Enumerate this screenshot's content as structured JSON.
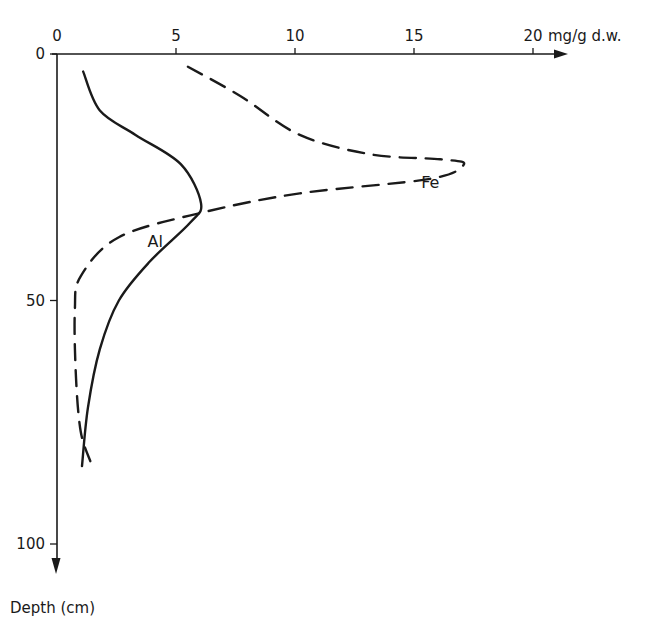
{
  "chart_data": {
    "type": "line",
    "title": "",
    "xlabel": "mg/g d.w.",
    "ylabel": "Depth (cm)",
    "x_axis_position": "top",
    "y_axis_inverted": true,
    "xlim": [
      0,
      21
    ],
    "ylim": [
      0,
      105
    ],
    "x_ticks": [
      0,
      5,
      10,
      15,
      20
    ],
    "x_tick_labels": [
      "0",
      "5",
      "10",
      "15",
      "20"
    ],
    "y_ticks": [
      0,
      50,
      100
    ],
    "y_tick_labels": [
      "0",
      "50",
      "100"
    ],
    "grid": false,
    "legend": "inline labels",
    "series": [
      {
        "name": "Al",
        "style": "solid",
        "label_position": {
          "x": 3.8,
          "depth": 39
        },
        "points": [
          {
            "x": 1.1,
            "depth": 3
          },
          {
            "x": 1.8,
            "depth": 11
          },
          {
            "x": 3.3,
            "depth": 16
          },
          {
            "x": 5.2,
            "depth": 22
          },
          {
            "x": 6.05,
            "depth": 30
          },
          {
            "x": 5.6,
            "depth": 34
          },
          {
            "x": 3.9,
            "depth": 42
          },
          {
            "x": 2.6,
            "depth": 50
          },
          {
            "x": 1.8,
            "depth": 60
          },
          {
            "x": 1.3,
            "depth": 72
          },
          {
            "x": 1.05,
            "depth": 84
          }
        ]
      },
      {
        "name": "Fe",
        "style": "dashed",
        "label_position": {
          "x": 15.3,
          "depth": 27
        },
        "points": [
          {
            "x": 5.5,
            "depth": 2
          },
          {
            "x": 7.7,
            "depth": 8
          },
          {
            "x": 10.2,
            "depth": 16
          },
          {
            "x": 13.2,
            "depth": 20
          },
          {
            "x": 16.1,
            "depth": 21
          },
          {
            "x": 17.1,
            "depth": 22
          },
          {
            "x": 15.7,
            "depth": 25
          },
          {
            "x": 10.2,
            "depth": 28
          },
          {
            "x": 6.05,
            "depth": 32
          },
          {
            "x": 2.6,
            "depth": 37
          },
          {
            "x": 1.0,
            "depth": 45
          },
          {
            "x": 0.75,
            "depth": 52
          },
          {
            "x": 0.8,
            "depth": 66
          },
          {
            "x": 1.0,
            "depth": 77
          },
          {
            "x": 1.4,
            "depth": 83
          }
        ]
      }
    ]
  },
  "labels": {
    "x_unit": "mg/g d.w.",
    "y_title": "Depth (cm)",
    "al": "Al",
    "fe": "Fe"
  },
  "colors": {
    "ink": "#1a1a1a",
    "background": "#ffffff"
  }
}
